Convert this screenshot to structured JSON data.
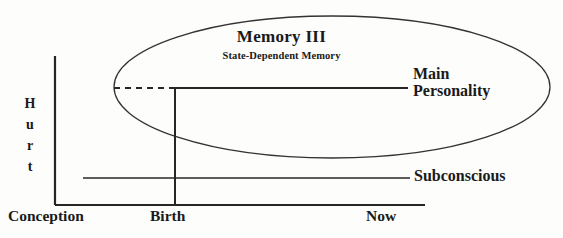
{
  "diagram": {
    "title": "Memory III",
    "subtitle": "State-Dependent Memory",
    "labels": {
      "main_personality_line1": "Main",
      "main_personality_line2": "Personality",
      "subconscious": "Subconscious",
      "hurt_axis_letters": [
        "H",
        "u",
        "r",
        "t"
      ],
      "x_axis_conception": "Conception",
      "x_axis_birth": "Birth",
      "x_axis_now": "Now"
    },
    "colors": {
      "ink": "#1a1a1a",
      "line": "#2b2b2b",
      "background": "#fdfdfc"
    },
    "geometry": {
      "y_axis_x": 55,
      "y_axis_top": 56,
      "x_axis_y": 205,
      "x_axis_right": 425,
      "birth_x": 175,
      "main_personality_y": 88,
      "main_personality_line_end_x": 408,
      "dashed_start_x": 114,
      "subconscious_y": 178,
      "subconscious_line_start_x": 83,
      "subconscious_line_end_x": 410,
      "ellipse_cx": 332,
      "ellipse_cy": 87,
      "ellipse_rx": 218,
      "ellipse_ry": 71
    }
  }
}
